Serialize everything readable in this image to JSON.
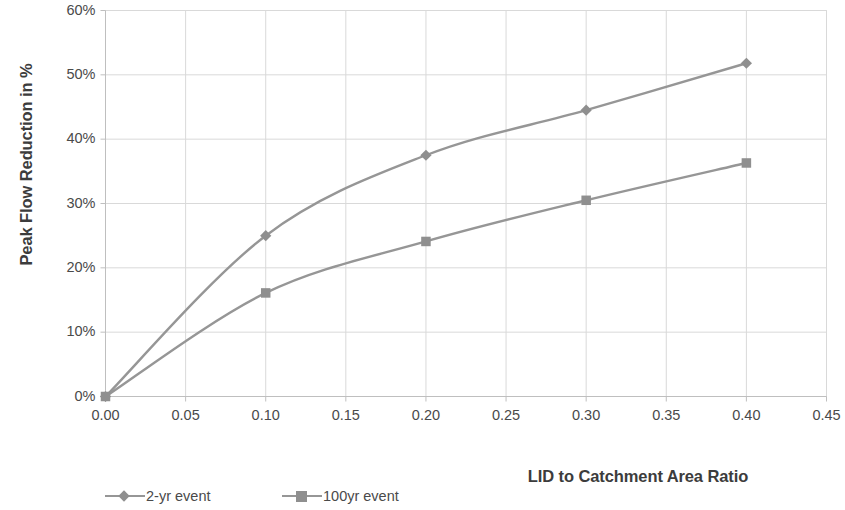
{
  "chart_data": {
    "type": "line",
    "title": "",
    "xlabel": "LID to Catchment Area Ratio",
    "ylabel": "Peak Flow Reduction in %",
    "x": [
      0.0,
      0.1,
      0.2,
      0.3,
      0.4
    ],
    "series": [
      {
        "name": "2-yr event",
        "marker": "diamond",
        "values": [
          0,
          25.0,
          37.5,
          44.5,
          51.8
        ]
      },
      {
        "name": "100yr event",
        "marker": "square",
        "values": [
          0,
          16.1,
          24.1,
          30.5,
          36.3
        ]
      }
    ],
    "xlim": [
      0.0,
      0.45
    ],
    "ylim": [
      0,
      60
    ],
    "xticks": [
      "0.00",
      "0.05",
      "0.10",
      "0.15",
      "0.20",
      "0.25",
      "0.30",
      "0.35",
      "0.40",
      "0.45"
    ],
    "xtick_values": [
      0.0,
      0.05,
      0.1,
      0.15,
      0.2,
      0.25,
      0.3,
      0.35,
      0.4,
      0.45
    ],
    "yticks": [
      "0%",
      "10%",
      "20%",
      "30%",
      "40%",
      "50%",
      "60%"
    ],
    "ytick_values": [
      0,
      10,
      20,
      30,
      40,
      50,
      60
    ],
    "grid": true,
    "grid_x": true,
    "grid_y": true,
    "legend_position": "bottom",
    "colors": {
      "series_line": "#969696",
      "series_marker": "#8f8f8f",
      "grid": "#d9d9d9",
      "axis": "#bfbfbf",
      "text": "#4a4a4a",
      "title_text": "#3c3c3c",
      "background": "#ffffff"
    }
  },
  "axis": {
    "y_title": "Peak Flow Reduction in %",
    "x_title": "LID to Catchment Area Ratio"
  },
  "legend": {
    "items": [
      {
        "label": "2-yr event"
      },
      {
        "label": "100yr event"
      }
    ]
  }
}
